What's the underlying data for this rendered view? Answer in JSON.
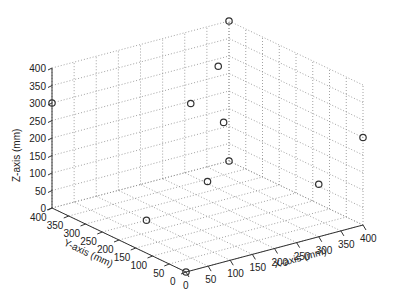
{
  "chart_data": {
    "type": "scatter",
    "projection": "3d",
    "title": "",
    "xlabel": "X-axis (mm)",
    "ylabel": "Y-axis (mm)",
    "zlabel": "Z-axis (mm)",
    "xlim": [
      0,
      400
    ],
    "ylim": [
      0,
      400
    ],
    "zlim": [
      0,
      400
    ],
    "x_ticks": [
      "0",
      "50",
      "100",
      "150",
      "200",
      "250",
      "300",
      "350",
      "400"
    ],
    "y_ticks": [
      "0",
      "50",
      "100",
      "150",
      "200",
      "250",
      "300",
      "350",
      "400"
    ],
    "z_ticks": [
      "0",
      "50",
      "100",
      "150",
      "200",
      "250",
      "300",
      "350",
      "400"
    ],
    "grid": true,
    "marker": "circle",
    "points": [
      {
        "x": 0,
        "y": 0,
        "z": 0
      },
      {
        "x": 400,
        "y": 400,
        "z": 400
      },
      {
        "x": 0,
        "y": 400,
        "z": 300
      },
      {
        "x": 300,
        "y": 300,
        "z": 350
      },
      {
        "x": 200,
        "y": 250,
        "z": 300
      },
      {
        "x": 350,
        "y": 350,
        "z": 150
      },
      {
        "x": 400,
        "y": 400,
        "z": 0
      },
      {
        "x": 400,
        "y": 0,
        "z": 250
      },
      {
        "x": 200,
        "y": 200,
        "z": 100
      },
      {
        "x": 300,
        "y": 0,
        "z": 150
      },
      {
        "x": 100,
        "y": 250,
        "z": 0
      }
    ]
  }
}
